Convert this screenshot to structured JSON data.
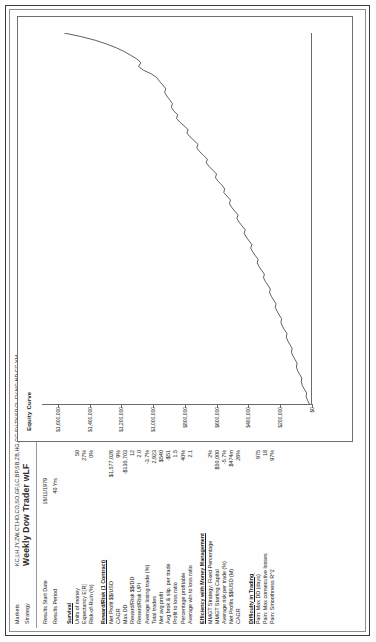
{
  "report": {
    "markets_label": "Markets",
    "markets_value": "KC,LH,JY,ZW,CT,HO,CO,SO,GF,LC,BP,SB,ZB,HG,GC,SV,TY,SP,CL,FV,NG,ND,EC,YM",
    "strategy_label": "Strategy",
    "strategy_value": "Weekly Dow Trader wLF",
    "results_start_date_label": "Results Start Date",
    "results_start_date_value": "16/11/1979",
    "results_period_label": "Results Period",
    "results_period_value": "40 Yrs"
  },
  "groups": [
    {
      "title": "Survival",
      "rows": [
        {
          "label": "Units of money",
          "value": "50"
        },
        {
          "label": "Expectancy E[R]",
          "value": "27%"
        },
        {
          "label": "Risk-of-Ruin (%)",
          "value": "0%"
        }
      ]
    },
    {
      "title": "Reward/Risk (1 Contract)",
      "rows": [
        {
          "label": "Net Profit $$/USD",
          "value": "$1,577,026"
        },
        {
          "label": "CAGR",
          "value": "9%"
        },
        {
          "label": "Max DD",
          "value": "-$130,703"
        },
        {
          "label": "Reward/Risk  $$/DD",
          "value": "12"
        },
        {
          "label": "Reward/Risk  UPI",
          "value": "2.0"
        },
        {
          "label": "Average losing trade (%)",
          "value": "-3.7%"
        },
        {
          "label": "Total trades",
          "value": "2,923"
        },
        {
          "label": "Net avg profit",
          "value": "$540"
        },
        {
          "label": "Avg brok.& slip. per trade",
          "value": "-$51"
        },
        {
          "label": "Profit to loss ratio",
          "value": "1.5"
        },
        {
          "label": "Percentage profitable",
          "value": "40%"
        },
        {
          "label": "Average win to loss ratio",
          "value": "2.1"
        }
      ]
    },
    {
      "title": "Efficiency with Money Management",
      "rows": [
        {
          "label": "MMGT Strategy: Fixed Percentage",
          "value": "2%"
        },
        {
          "label": "MMGT Starting Capital",
          "value": "$50,000"
        },
        {
          "label": "Average risk per trade (%)",
          "value": "-5.7%"
        },
        {
          "label": "Net Profits $$/USD (M)",
          "value": "$474m"
        },
        {
          "label": "CAGR",
          "value": "26%"
        }
      ]
    },
    {
      "title": "Difficulty in Trading",
      "rows": [
        {
          "label": "Pain: Max DD (days)",
          "value": "975"
        },
        {
          "label": "Pain: Max consecutive losses",
          "value": "18"
        },
        {
          "label": "Pain: Smoothness R^2",
          "value": "97%"
        }
      ]
    }
  ],
  "chart_data": {
    "type": "line",
    "title": "Equity Curve",
    "xlabel": "",
    "ylabel": "",
    "ylim": [
      0,
      1700000
    ],
    "grid": false,
    "legend": null,
    "yticks": [
      0,
      200000,
      400000,
      600000,
      800000,
      1000000,
      1200000,
      1400000,
      1600000
    ],
    "ytick_labels": [
      "$0",
      "$200,000",
      "$400,000",
      "$600,000",
      "$800,000",
      "$1,000,000",
      "$1,200,000",
      "$1,400,000",
      "$1,600,000"
    ],
    "series": [
      {
        "name": "Equity Curve",
        "x": [
          0,
          1,
          2,
          3,
          4,
          5,
          6,
          7,
          8,
          9,
          10,
          11,
          12,
          13,
          14,
          15,
          16,
          17,
          18,
          19,
          20,
          21,
          22,
          23,
          24,
          25,
          26,
          27,
          28,
          29,
          30,
          31,
          32,
          33,
          34,
          35,
          36,
          37,
          38,
          39,
          40,
          41,
          42,
          43,
          44,
          45,
          46,
          47,
          48,
          49,
          50,
          51,
          52,
          53,
          54,
          55,
          56,
          57,
          58,
          59,
          60,
          61,
          62,
          63,
          64,
          65,
          66,
          67,
          68,
          69,
          70,
          71,
          72,
          73,
          74,
          75,
          76,
          77,
          78,
          79,
          80,
          81,
          82,
          83,
          84,
          85,
          86,
          87,
          88,
          89,
          90,
          91,
          92,
          93,
          94,
          95,
          96,
          97,
          98,
          99,
          100
        ],
        "values": [
          10000,
          22000,
          31000,
          28000,
          42000,
          55000,
          61000,
          58000,
          72000,
          85000,
          92000,
          88000,
          101000,
          115000,
          124000,
          119000,
          133000,
          147000,
          156000,
          152000,
          168000,
          181000,
          190000,
          186000,
          201000,
          214000,
          226000,
          221000,
          236000,
          250000,
          262000,
          257000,
          272000,
          288000,
          300000,
          295000,
          312000,
          327000,
          340000,
          334000,
          352000,
          368000,
          381000,
          374000,
          392000,
          409000,
          422000,
          416000,
          436000,
          454000,
          468000,
          461000,
          482000,
          501000,
          516000,
          509000,
          530000,
          551000,
          546000,
          563000,
          586000,
          604000,
          597000,
          620000,
          643000,
          662000,
          655000,
          679000,
          703000,
          722000,
          714000,
          739000,
          764000,
          784000,
          777000,
          803000,
          829000,
          850000,
          843000,
          868000,
          882000,
          876000,
          893000,
          911000,
          925000,
          918000,
          937000,
          958000,
          975000,
          1010000,
          1060000,
          1090000,
          1075000,
          1100000,
          1140000,
          1180000,
          1230000,
          1290000,
          1360000,
          1450000,
          1560000
        ]
      }
    ]
  }
}
